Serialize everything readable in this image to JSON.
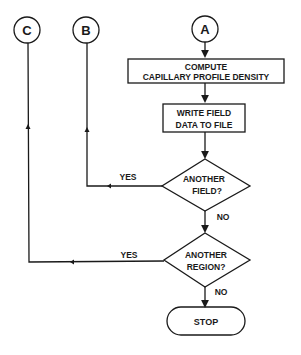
{
  "connectors": {
    "a": "A",
    "b": "B",
    "c": "C"
  },
  "steps": {
    "compute_line1": "COMPUTE",
    "compute_line2": "CAPILLARY PROFILE DENSITY",
    "write_line1": "WRITE FIELD",
    "write_line2": "DATA TO FILE"
  },
  "decisions": {
    "field_line1": "ANOTHER",
    "field_line2": "FIELD?",
    "region_line1": "ANOTHER",
    "region_line2": "REGION?"
  },
  "labels": {
    "yes_field": "YES",
    "no_field": "NO",
    "yes_region": "YES",
    "no_region": "NO"
  },
  "terminal": {
    "stop": "STOP"
  },
  "colors": {
    "stroke": "#1a1a1a",
    "background": "#ffffff"
  }
}
